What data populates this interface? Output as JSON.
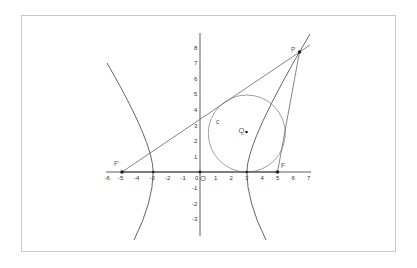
{
  "figure": {
    "type": "hyperbola-incircle-diagram",
    "origin_label": "O",
    "axes": {
      "x_ticks": [
        "-6",
        "-5",
        "-4",
        "-3",
        "-2",
        "-1",
        "0",
        "1",
        "2",
        "3",
        "4",
        "5",
        "6",
        "7"
      ],
      "y_ticks_positive": [
        "1",
        "2",
        "3",
        "4",
        "5",
        "6",
        "7",
        "8"
      ],
      "y_ticks_negative": [
        "-1",
        "-2",
        "-3"
      ]
    },
    "points": {
      "left_focus": {
        "label": "F'",
        "x": -5,
        "y": 0
      },
      "right_focus": {
        "label": "F",
        "x": 5,
        "y": 0
      },
      "point_on_hyperbola": {
        "label": "P",
        "x": 6.4,
        "y": 7.6
      },
      "incircle_center": {
        "label": "Q",
        "x": 3,
        "y": 2.5
      },
      "circle_label": {
        "label": "c"
      }
    },
    "hyperbola": {
      "a": 3,
      "b": 4,
      "equation": "x²/9 − y²/16 = 1"
    },
    "colors": {
      "curve": "#555555",
      "axis": "#333333",
      "frame": "#c8c8c8",
      "point": "#222222"
    }
  }
}
